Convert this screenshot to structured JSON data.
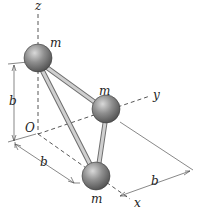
{
  "diagram": {
    "axes": {
      "x": "x",
      "y": "y",
      "z": "z",
      "origin": "O"
    },
    "masses": [
      {
        "label": "m",
        "position": "on z-axis at height b"
      },
      {
        "label": "m",
        "position": "on y-axis at distance b"
      },
      {
        "label": "m",
        "position": "on x-axis at distance b"
      }
    ],
    "dimensions": [
      {
        "label": "b",
        "axis": "z"
      },
      {
        "label": "b",
        "axis": "x"
      },
      {
        "label": "b",
        "axis": "y"
      }
    ],
    "colors": {
      "ball": "#8a8a8a",
      "rod": "#b8b8b8",
      "line": "#333333"
    }
  }
}
